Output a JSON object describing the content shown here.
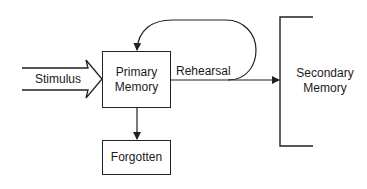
{
  "diagram": {
    "type": "flow",
    "nodes": {
      "stimulus": {
        "label": "Stimulus",
        "shape": "block-arrow"
      },
      "primary": {
        "label_line1": "Primary",
        "label_line2": "Memory",
        "shape": "box"
      },
      "forgotten": {
        "label": "Forgotten",
        "shape": "box"
      },
      "secondary": {
        "label_line1": "Secondary",
        "label_line2": "Memory",
        "shape": "bracket"
      }
    },
    "edges": [
      {
        "from": "stimulus",
        "to": "primary",
        "label": ""
      },
      {
        "from": "primary",
        "to": "secondary",
        "label": "Rehearsal"
      },
      {
        "from": "primary",
        "to": "primary",
        "label": "",
        "kind": "loop"
      },
      {
        "from": "primary",
        "to": "forgotten",
        "label": ""
      }
    ],
    "rehearsal_label": "Rehearsal",
    "colors": {
      "stroke": "#222222",
      "background": "#ffffff",
      "text": "#1a1a1a"
    }
  }
}
